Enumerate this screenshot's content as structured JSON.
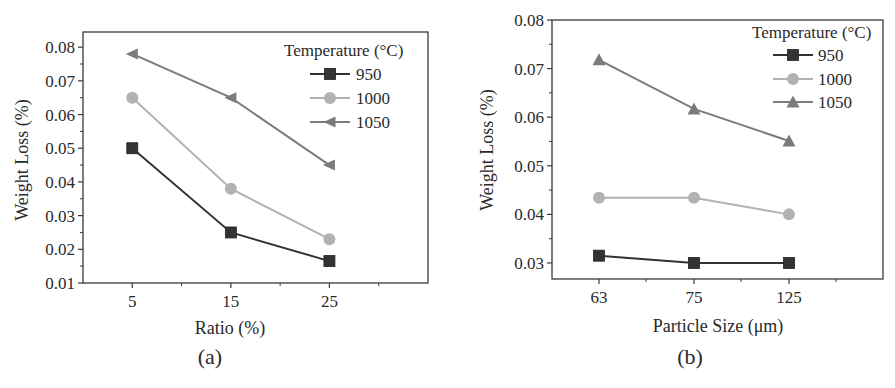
{
  "figure": {
    "colors": {
      "axis": "#3a3a3a",
      "text": "#2a2a2a",
      "series_950": "#333333",
      "series_1000": "#b2b2b2",
      "series_1050": "#7b7b7b"
    }
  },
  "chart_data": [
    {
      "id": "a",
      "type": "line",
      "caption": "(a)",
      "title": "",
      "xlabel": "Ratio (%)",
      "ylabel": "Weight Loss (%)",
      "x": [
        5,
        15,
        25
      ],
      "x_tick_labels": [
        "5",
        "15",
        "25"
      ],
      "xlim": [
        0,
        35
      ],
      "ylim": [
        0.01,
        0.0845
      ],
      "y_ticks": [
        0.01,
        0.02,
        0.03,
        0.04,
        0.05,
        0.06,
        0.07,
        0.08
      ],
      "y_tick_labels": [
        "0.01",
        "0.02",
        "0.03",
        "0.04",
        "0.05",
        "0.06",
        "0.07",
        "0.08"
      ],
      "grid": false,
      "legend": {
        "title": "Temperature (°C)",
        "position": "upper right"
      },
      "series": [
        {
          "name": "950",
          "marker": "square",
          "values": [
            0.05,
            0.025,
            0.0165
          ]
        },
        {
          "name": "1000",
          "marker": "circle",
          "values": [
            0.065,
            0.038,
            0.023
          ]
        },
        {
          "name": "1050",
          "marker": "triangle-left",
          "values": [
            0.078,
            0.065,
            0.045
          ]
        }
      ],
      "layout": {
        "plot": {
          "left": 83,
          "right": 428,
          "top": 32,
          "bottom": 283
        },
        "x_minor_ticks": [
          10,
          20,
          30
        ],
        "legend": {
          "title_x": 284,
          "title_y": 56,
          "line_x1": 310,
          "line_x2": 350,
          "text_x": 356,
          "row_y": [
            74,
            98,
            122
          ]
        },
        "xlabel_pos": [
          230,
          334
        ],
        "ylabel_pos": [
          28,
          160
        ],
        "caption_pos": [
          210,
          364
        ]
      }
    },
    {
      "id": "b",
      "type": "line",
      "caption": "(b)",
      "title": "",
      "xlabel": "Particle Size (μm)",
      "ylabel": "Weight Loss (%)",
      "x": [
        63,
        75,
        125
      ],
      "x_tick_labels": [
        "63",
        "75",
        "125"
      ],
      "x_categorical": true,
      "ylim": [
        0.0267,
        0.08
      ],
      "y_ticks": [
        0.03,
        0.04,
        0.05,
        0.06,
        0.07,
        0.08
      ],
      "y_tick_labels": [
        "0.03",
        "0.04",
        "0.05",
        "0.06",
        "0.07",
        "0.08"
      ],
      "grid": false,
      "legend": {
        "title": "Temperature (°C)",
        "position": "upper right"
      },
      "series": [
        {
          "name": "950",
          "marker": "square",
          "values": [
            0.0315,
            0.03,
            0.03
          ]
        },
        {
          "name": "1000",
          "marker": "circle",
          "values": [
            0.0434,
            0.0434,
            0.04
          ]
        },
        {
          "name": "1050",
          "marker": "triangle-up",
          "values": [
            0.0718,
            0.0617,
            0.0551
          ]
        }
      ],
      "layout": {
        "plot": {
          "left": 552,
          "right": 883,
          "top": 20,
          "bottom": 279
        },
        "x_positions": [
          599,
          694,
          789
        ],
        "x_minor_positions": [
          646,
          741,
          836
        ],
        "legend": {
          "title_x": 752,
          "title_y": 38,
          "line_x1": 773,
          "line_x2": 813,
          "text_x": 818,
          "row_y": [
            55,
            79,
            102
          ]
        },
        "xlabel_pos": [
          718,
          332
        ],
        "ylabel_pos": [
          493,
          150
        ],
        "caption_pos": [
          690,
          364
        ]
      }
    }
  ]
}
